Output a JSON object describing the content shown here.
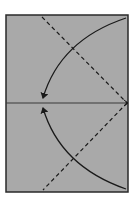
{
  "diagram": {
    "type": "origami-fold-instruction",
    "paper": {
      "fill": "#a9a9a9",
      "stroke": "#2a2a2a",
      "x": 6,
      "y": 15,
      "width": 122,
      "height": 177
    },
    "center_crease": {
      "style": "solid",
      "color": "#3a3a3a",
      "y": 103
    },
    "valley_folds": [
      {
        "name": "upper-diagonal",
        "from": [
          42,
          17
        ],
        "to": [
          127,
          103
        ],
        "style": "dashed"
      },
      {
        "name": "lower-diagonal",
        "from": [
          127,
          103
        ],
        "to": [
          43,
          190
        ],
        "style": "dashed"
      }
    ],
    "fold_arrows": [
      {
        "name": "top-corner-arrow",
        "from": [
          126,
          18
        ],
        "to": [
          43,
          98
        ],
        "direction": "down-left"
      },
      {
        "name": "bottom-corner-arrow",
        "from": [
          126,
          189
        ],
        "to": [
          43,
          108
        ],
        "direction": "up-left"
      }
    ],
    "colors": {
      "line": "#1a1a1a",
      "paper": "#a9a9a9",
      "background": "#ffffff"
    }
  }
}
